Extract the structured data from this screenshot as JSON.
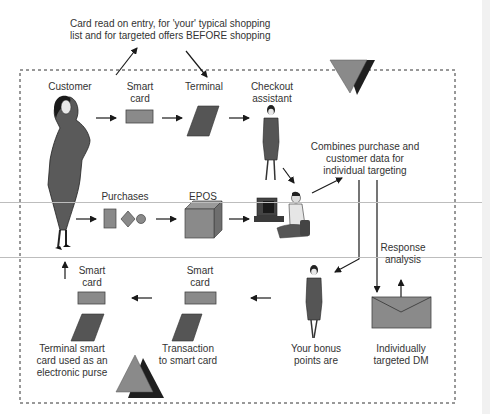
{
  "diagram": {
    "top_note": {
      "line1": "Card read on entry, for 'your' typical shopping",
      "line2": "list and for targeted offers BEFORE shopping"
    },
    "nodes": {
      "customer": {
        "label": "Customer"
      },
      "smart_card_top": {
        "line1": "Smart",
        "line2": "card"
      },
      "terminal": {
        "label": "Terminal"
      },
      "checkout_assistant": {
        "line1": "Checkout",
        "line2": "assistant"
      },
      "purchases": {
        "label": "Purchases"
      },
      "epos": {
        "label": "EPOS"
      },
      "combines_note": {
        "line1": "Combines purchase and",
        "line2": "customer data for",
        "line3": "individual targeting"
      },
      "response_analysis": {
        "line1": "Response",
        "line2": "analysis"
      },
      "smart_card_left": {
        "line1": "Smart",
        "line2": "card"
      },
      "smart_card_mid": {
        "line1": "Smart",
        "line2": "card"
      },
      "terminal_purse": {
        "line1": "Terminal smart",
        "line2": "card used as an",
        "line3": "electronic purse"
      },
      "transaction": {
        "line1": "Transaction",
        "line2": "to smart card"
      },
      "bonus_points": {
        "line1": "Your bonus",
        "line2": "points are"
      },
      "targeted_dm": {
        "line1": "Individually",
        "line2": "targeted DM"
      }
    },
    "colors": {
      "shape_fill": "#8a8a8a",
      "shape_dark": "#4a4a4a",
      "outline": "#1a1a1a",
      "border_dash": "#333333"
    }
  }
}
